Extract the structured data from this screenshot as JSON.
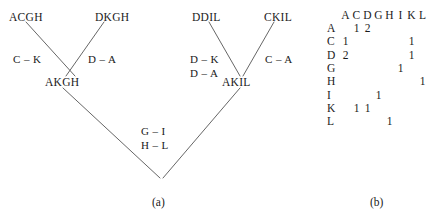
{
  "figure": {
    "panel_a_caption": "(a)",
    "panel_b_caption": "(b)",
    "line_color": "#555555"
  },
  "tree": {
    "leaves": [
      {
        "name": "leaf-acgh",
        "label": "ACGH"
      },
      {
        "name": "leaf-dkgh",
        "label": "DKGH"
      },
      {
        "name": "leaf-ddil",
        "label": "DDIL"
      },
      {
        "name": "leaf-ckil",
        "label": "CKIL"
      }
    ],
    "internal_nodes": [
      {
        "name": "node-akgh",
        "label": "AKGH"
      },
      {
        "name": "node-akil",
        "label": "AKIL"
      }
    ],
    "edge_labels": [
      {
        "name": "edge-label-c-k",
        "lines": [
          "C – K"
        ]
      },
      {
        "name": "edge-label-d-a",
        "lines": [
          "D – A"
        ]
      },
      {
        "name": "edge-label-d-k-d-a",
        "lines": [
          "D – K",
          "D – A"
        ]
      },
      {
        "name": "edge-label-c-a",
        "lines": [
          "C – A"
        ]
      },
      {
        "name": "edge-label-g-i-h-l",
        "lines": [
          "G – I",
          "H – L"
        ]
      }
    ]
  },
  "matrix": {
    "corner": "",
    "columns": [
      "A",
      "C",
      "D",
      "G",
      "H",
      "I",
      "K",
      "L"
    ],
    "rows": [
      {
        "label": "A",
        "values": [
          "",
          "1",
          "2",
          "",
          "",
          "",
          "",
          ""
        ]
      },
      {
        "label": "C",
        "values": [
          "1",
          "",
          "",
          "",
          "",
          "",
          "1",
          ""
        ]
      },
      {
        "label": "D",
        "values": [
          "2",
          "",
          "",
          "",
          "",
          "",
          "1",
          ""
        ]
      },
      {
        "label": "G",
        "values": [
          "",
          "",
          "",
          "",
          "",
          "1",
          "",
          ""
        ]
      },
      {
        "label": "H",
        "values": [
          "",
          "",
          "",
          "",
          "",
          "",
          "",
          "1"
        ]
      },
      {
        "label": "I",
        "values": [
          "",
          "",
          "",
          "1",
          "",
          "",
          "",
          ""
        ]
      },
      {
        "label": "K",
        "values": [
          "",
          "1",
          "1",
          "",
          "",
          "",
          "",
          ""
        ]
      },
      {
        "label": "L",
        "values": [
          "",
          "",
          "",
          "",
          "1",
          "",
          "",
          ""
        ]
      }
    ]
  }
}
